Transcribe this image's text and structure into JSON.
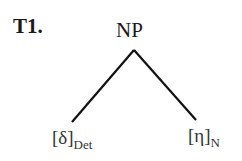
{
  "tree": {
    "id_label": "T1.",
    "root": {
      "label": "NP"
    },
    "children": [
      {
        "segment": "[δ]",
        "category": "Det"
      },
      {
        "segment": "[η]",
        "category": "N"
      }
    ]
  }
}
